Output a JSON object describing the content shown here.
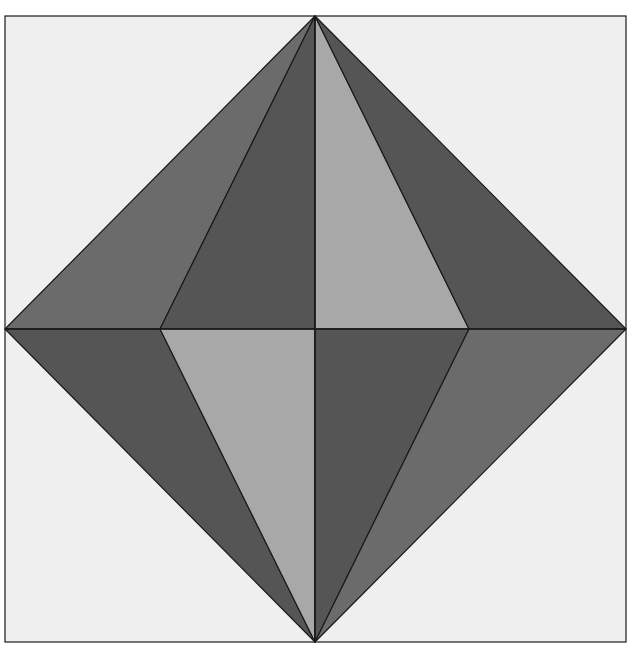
{
  "diagram": {
    "title": "",
    "colors": {
      "page_background": "#ffffff",
      "square_fill": "#efefef",
      "stroke": "#1a1a1a",
      "medium_gray": "#6b6b6b",
      "dark_gray": "#555555",
      "light_gray": "#a8a8a8"
    },
    "frame": {
      "x": 5,
      "y": 16,
      "width": 621,
      "height": 626
    },
    "vertices": {
      "top": [
        315,
        16
      ],
      "bottom": [
        315,
        642
      ],
      "left": [
        5,
        329
      ],
      "right": [
        626,
        329
      ],
      "center": [
        315,
        329
      ],
      "inner_left": [
        160,
        329
      ],
      "inner_right": [
        469,
        329
      ]
    },
    "triangles": [
      {
        "name": "upper-outer-left",
        "points": "315,16 5,329 160,329",
        "shade": "medium_gray"
      },
      {
        "name": "upper-inner-left",
        "points": "315,16 160,329 315,329",
        "shade": "dark_gray"
      },
      {
        "name": "upper-inner-right",
        "points": "315,16 315,329 469,329",
        "shade": "light_gray"
      },
      {
        "name": "upper-outer-right",
        "points": "315,16 469,329 626,329",
        "shade": "dark_gray"
      },
      {
        "name": "lower-outer-left",
        "points": "5,329 160,329 315,642",
        "shade": "dark_gray"
      },
      {
        "name": "lower-inner-left",
        "points": "160,329 315,329 315,642",
        "shade": "light_gray"
      },
      {
        "name": "lower-inner-right",
        "points": "315,329 469,329 315,642",
        "shade": "dark_gray"
      },
      {
        "name": "lower-outer-right",
        "points": "469,329 626,329 315,642",
        "shade": "medium_gray"
      }
    ]
  }
}
